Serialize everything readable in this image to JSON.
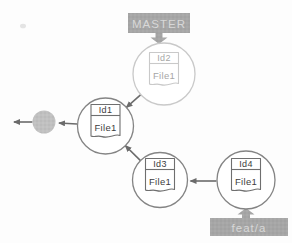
{
  "diagram": {
    "branch_labels": [
      {
        "name": "MASTER",
        "points_to": "Id2"
      },
      {
        "name": "feat/a",
        "points_to": "Id4"
      }
    ],
    "nodes": [
      {
        "id": "Id1",
        "file": "File1",
        "emphasis": "normal"
      },
      {
        "id": "Id2",
        "file": "File1",
        "emphasis": "faded"
      },
      {
        "id": "Id3",
        "file": "File1",
        "emphasis": "normal"
      },
      {
        "id": "Id4",
        "file": "File1",
        "emphasis": "normal"
      }
    ],
    "edges": [
      {
        "from": "Id2",
        "to": "Id1"
      },
      {
        "from": "Id3",
        "to": "Id1"
      },
      {
        "from": "Id4",
        "to": "Id3"
      },
      {
        "from": "Id1",
        "to": "truncated-history"
      },
      {
        "from": "truncated-history",
        "to": "offscreen-left"
      }
    ],
    "colors": {
      "label_bg": "#a6a6a6",
      "label_text": "#d8d8d8",
      "node_stroke": "#848484",
      "faded_node_stroke": "#c9c9c9",
      "node_text": "#3d3d3d",
      "faded_node_text": "#a6a6a6",
      "edge": "#6b6b6b",
      "filled_node": "#c0c0c0",
      "background": "#fdfdfd"
    }
  }
}
